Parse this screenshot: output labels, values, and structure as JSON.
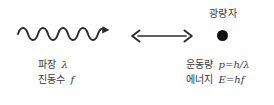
{
  "figure": {
    "type": "wave-particle-duality-diagram",
    "background_color": "#ffffff",
    "ink_color": "#3a3a3a"
  },
  "wave": {
    "icon_name": "sine-wave-with-arrow",
    "cycles": 6,
    "direction": "rightward"
  },
  "center": {
    "icon_name": "double-headed-arrow",
    "meaning": "equivalence"
  },
  "particle": {
    "label": "광량자",
    "icon_name": "filled-circle",
    "color": "#111111"
  },
  "left_labels": [
    {
      "term": "파장",
      "symbol": "λ"
    },
    {
      "term": "진동수",
      "symbol": "f"
    }
  ],
  "right_labels": [
    {
      "term": "운동량",
      "symbol": "p",
      "op": "=",
      "expr": "h/λ"
    },
    {
      "term": "에너지",
      "symbol": "E",
      "op": "=",
      "expr": "hf"
    }
  ]
}
